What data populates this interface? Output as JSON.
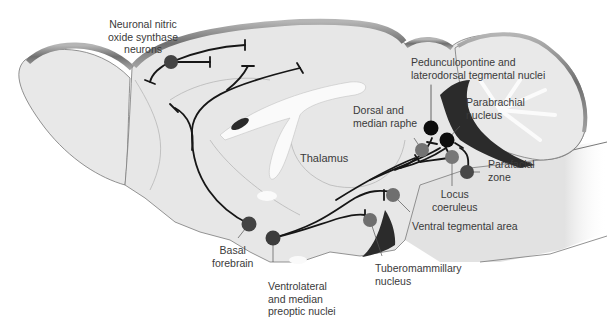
{
  "diagram": {
    "title": "",
    "colors": {
      "brain_fill": "#e6e6e6",
      "brain_edge": "#7a7a7a",
      "rim_dark": "#8c8c8c",
      "ventricle": "#f7f7f7",
      "dark_region": "#2b2b2b",
      "node_dark": "#3f3f3f",
      "node_mid": "#6e6e6e",
      "node_black": "#0d0d0d",
      "pathway": "#1a1a1a",
      "label_text": "#3a3a3a"
    },
    "labels": {
      "nnos": "Neuronal nitric\noxide synthase\nneurons",
      "thalamus": "Thalamus",
      "pedunculopontine": "Pedunculopontine and\nlaterodorsal tegmental nuclei",
      "parabrachial": "Parabrachial\nnucleus",
      "dorsal_raphe": "Dorsal and\nmedian raphe",
      "parafacial": "Parafacial\nzone",
      "locus": "Locus\ncoeruleus",
      "vta": "Ventral tegmental area",
      "tmn": "Tuberomammillary\nnucleus",
      "basal": "Basal\nforebrain",
      "vlpo": "Ventrolateral\nand median\npreoptic nuclei"
    },
    "nodes": [
      {
        "id": "nnos",
        "name": "Neuronal nitric oxide synthase neurons",
        "x": 171,
        "y": 62,
        "r": 7,
        "shade": "dark"
      },
      {
        "id": "basal_forebrain",
        "name": "Basal forebrain",
        "x": 249,
        "y": 224,
        "r": 7.5,
        "shade": "dark"
      },
      {
        "id": "vlpo",
        "name": "Ventrolateral and median preoptic nuclei",
        "x": 273,
        "y": 238,
        "r": 7.5,
        "shade": "dark"
      },
      {
        "id": "tmn",
        "name": "Tuberomammillary nucleus",
        "x": 370,
        "y": 220,
        "r": 7,
        "shade": "mid"
      },
      {
        "id": "vta",
        "name": "Ventral tegmental area",
        "x": 393,
        "y": 195,
        "r": 7,
        "shade": "mid"
      },
      {
        "id": "raphe",
        "name": "Dorsal and median raphe",
        "x": 422,
        "y": 150,
        "r": 7,
        "shade": "mid"
      },
      {
        "id": "ppt_ldt",
        "name": "Pedunculopontine and laterodorsal tegmental nuclei",
        "x": 431,
        "y": 128,
        "r": 7.5,
        "shade": "black"
      },
      {
        "id": "parabrachial",
        "name": "Parabrachial nucleus",
        "x": 447,
        "y": 140,
        "r": 7.5,
        "shade": "black"
      },
      {
        "id": "locus_coeruleus",
        "name": "Locus coeruleus",
        "x": 452,
        "y": 157,
        "r": 7,
        "shade": "mid"
      },
      {
        "id": "parafacial",
        "name": "Parafacial zone",
        "x": 467,
        "y": 172,
        "r": 7,
        "shade": "dark"
      }
    ]
  }
}
